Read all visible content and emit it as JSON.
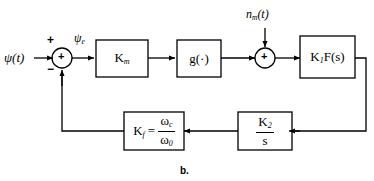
{
  "figure": {
    "caption": "b.",
    "type": "control-system-block-diagram",
    "line_color": "#000000",
    "background_color": "#ffffff"
  },
  "signals": {
    "input_label": "ψ(t)",
    "error_label": "ψ",
    "error_label_sub": "e",
    "noise_label": "n",
    "noise_label_sub": "m",
    "noise_label_tail": "(t)"
  },
  "summers": [
    {
      "name": "error-summer",
      "interior_sign": "+",
      "input_signs": [
        "+",
        "−"
      ],
      "plus_sign": "+",
      "minus_sign": "−"
    },
    {
      "name": "noise-summer",
      "interior_sign": "+"
    }
  ],
  "blocks": [
    {
      "id": "km",
      "label": "K",
      "sub": "m",
      "suffix": ""
    },
    {
      "id": "g",
      "label": "g",
      "sub": "",
      "suffix": "(·)"
    },
    {
      "id": "k1fs",
      "label": "K",
      "sub": "1",
      "suffix": "F(s)"
    },
    {
      "id": "k2s",
      "numerator": "K",
      "numerator_sub": "2",
      "denominator": "s"
    },
    {
      "id": "kf",
      "label": "K",
      "sub": "f",
      "equals": "=",
      "numerator": "ω",
      "numerator_sub": "c",
      "denominator": "ω",
      "denominator_sub": "0"
    }
  ]
}
